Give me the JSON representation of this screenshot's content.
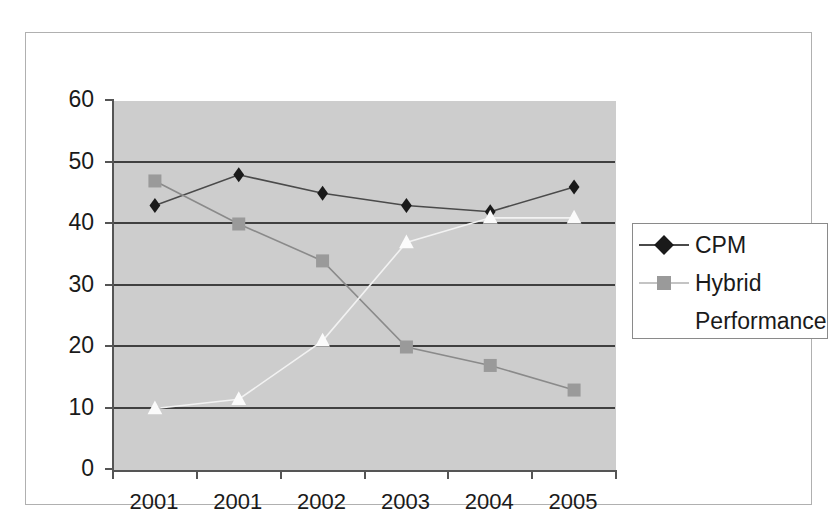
{
  "chart_data": {
    "type": "line",
    "title": "",
    "subtitle": "",
    "xlabel": "",
    "ylabel": "",
    "categories": [
      "2001",
      "2001",
      "2002",
      "2003",
      "2004",
      "2005"
    ],
    "ylim": [
      0,
      60
    ],
    "y_ticks": [
      0,
      10,
      20,
      30,
      40,
      50,
      60
    ],
    "y_tick_labels": [
      "0",
      "10",
      "20",
      "30",
      "40",
      "50",
      "60"
    ],
    "grid": "horizontal",
    "legend_position": "right",
    "plot_background": "#cdcdcd",
    "series": [
      {
        "name": "CPM",
        "marker": "diamond",
        "color": "#1a1a1a",
        "line_color": "#4a4a4a",
        "values": [
          43,
          48,
          45,
          43,
          42,
          46
        ]
      },
      {
        "name": "Hybrid",
        "marker": "square",
        "color": "#9a9a9a",
        "line_color": "#8a8a8a",
        "values": [
          47,
          40,
          34,
          20,
          17,
          13
        ]
      },
      {
        "name": "Performance",
        "marker": "triangle",
        "color": "#fbfbfb",
        "line_color": "#f2f2f2",
        "values": [
          10,
          11.5,
          21,
          37,
          41,
          41
        ]
      }
    ]
  },
  "legend": {
    "entries": [
      {
        "label": "CPM"
      },
      {
        "label": "Hybrid"
      },
      {
        "label": "Performance"
      }
    ]
  },
  "colors": {
    "cpm": "#1a1a1a",
    "hybrid": "#9a9a9a",
    "performance": "#fbfbfb",
    "gridline": "#404040",
    "axis": "#555555",
    "plot_bg": "#cdcdcd",
    "frame_border": "#b0b0b0"
  }
}
